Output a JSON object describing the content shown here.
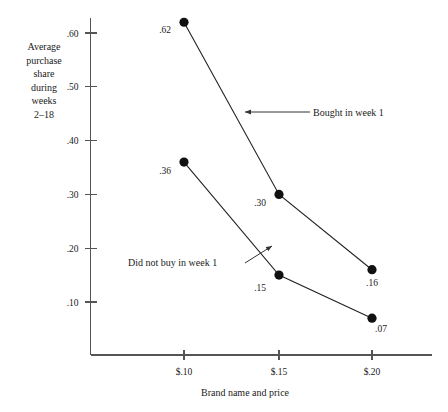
{
  "chart_data": {
    "type": "line",
    "title": "",
    "xlabel": "Brand  name and price",
    "ylabel": "Average purchase share during weeks 2–18",
    "ylabel_lines": [
      "Average",
      "purchase",
      "share",
      "during",
      "weeks",
      "2–18"
    ],
    "categories": [
      "$.10",
      "$.15",
      "$.20"
    ],
    "x_tick_labels": [
      "$.10",
      "$.15",
      "$.20"
    ],
    "y_tick_labels": [
      ".60",
      ".50",
      ".40",
      ".30",
      ".20",
      ".10"
    ],
    "y_tick_values": [
      0.6,
      0.5,
      0.4,
      0.3,
      0.2,
      0.1
    ],
    "ylim": [
      0.0,
      0.655
    ],
    "xlim": [
      0,
      2
    ],
    "grid": false,
    "legend_position": "inline-annotations",
    "series": [
      {
        "name": "Bought  in week 1",
        "values": [
          0.62,
          0.3,
          0.16
        ],
        "point_labels": [
          ".62",
          ".30",
          ".16"
        ],
        "color": "#222222"
      },
      {
        "name": "Did  not buy in week 1",
        "values": [
          0.36,
          0.15,
          0.07
        ],
        "point_labels": [
          ".36",
          ".15",
          ".07"
        ],
        "color": "#222222"
      }
    ],
    "annotations": [
      {
        "text": "Bought  in week 1",
        "target_series": 0,
        "text_x": 313,
        "text_y": 116,
        "arrow_from_x": 310,
        "arrow_from_y": 112,
        "arrow_to_x": 245,
        "arrow_to_y": 112
      },
      {
        "text": "Did  not buy in week 1",
        "target_series": 1,
        "text_x": 128,
        "text_y": 266,
        "arrow_from_x": 245,
        "arrow_from_y": 263,
        "arrow_to_x": 272,
        "arrow_to_y": 246
      }
    ]
  }
}
